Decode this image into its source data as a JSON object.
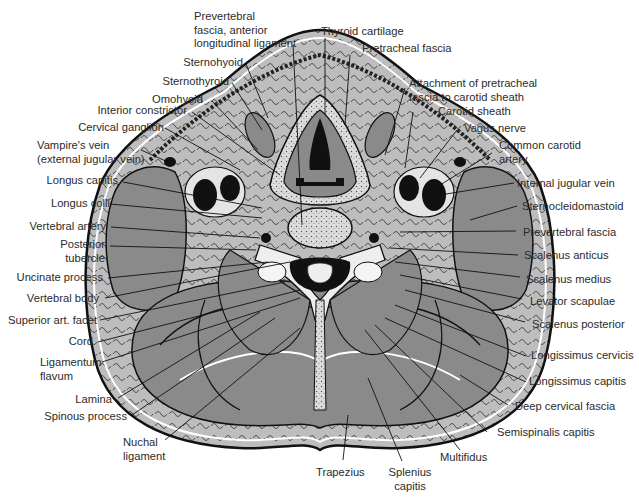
{
  "figure": {
    "colors": {
      "muscle": "#8a8a8a",
      "fat": "#bdbdbd",
      "bone": "#e6e6e6",
      "vessel": "#111111",
      "outline": "#111111",
      "background": "#ffffff"
    }
  },
  "labels": {
    "top": {
      "prevertebral_fascia_anterior": "Prevertebral\nfascia, anterior\nlongitudinal ligament",
      "thyroid_cartilage": "Thyroid cartilage",
      "pretracheal_fascia": "Pretracheal fascia"
    },
    "left": [
      "Sternohyoid",
      "Sternothyroid",
      "Omohyoid",
      "Interior constrictor",
      "Cervical ganglion",
      "Vampire's vein\n(external jugular vein)",
      "Longus capitis",
      "Longus colli",
      "Vertebral artery",
      "Posterior\ntubercle",
      "Uncinate process",
      "Vertebral body",
      "Superior art. facet",
      "Cord",
      "Ligamentum\nflavum",
      "Lamina",
      "Spinous process",
      "Nuchal\nligament"
    ],
    "right": [
      "Attachment of pretracheal\nfascia to carotid sheath",
      "Carotid sheath",
      "Vagus nerve",
      "Common carotid\nartery",
      "Internal jugular vein",
      "Sternocleidomastoid",
      "Prevertebral fascia",
      "Scalenus anticus",
      "Scalenus medius",
      "Levator scapulae",
      "Scalenus posterior",
      "Longissimus cervicis",
      "Longissimus capitis",
      "Deep cervical fascia",
      "Semispinalis capitis"
    ],
    "bottom": [
      "Multifidus",
      "Trapezius",
      "Splenius\ncapitis"
    ]
  }
}
